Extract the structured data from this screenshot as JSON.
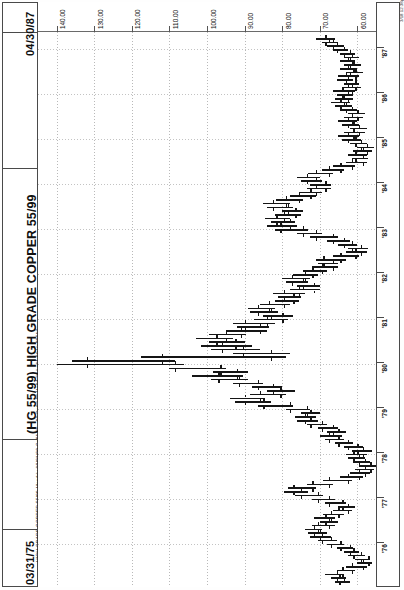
{
  "header": {
    "date_end": "04/30/87",
    "date_start": "03/31/75",
    "title": "(HG 55/99) HIGH GRADE COPPER 55/99",
    "stats_line": "HIGH GRADE COPPER 55/99-Monthly  03/31/99  C=61.75  -.60  O=62.55  H=64.75  L=61.60  V=89517",
    "copyright": "3/18 12:38pm Printed using TradeStation © Omega Research, Inc. 1997"
  },
  "chart_data": {
    "type": "bar",
    "subtype": "ohlc-bar-chart-rotated-90ccw",
    "title": "(HG 55/99) HIGH GRADE COPPER 55/99",
    "xlabel": "Date (monthly)",
    "ylabel": "Price (cents per pound)",
    "xlim": [
      "1975-03-31",
      "1987-04-30"
    ],
    "ylim": [
      55.0,
      145.0
    ],
    "grid": true,
    "legend": false,
    "price_ticks": [
      "140.00",
      "130.00",
      "120.00",
      "110.00",
      "100.00",
      "90.00",
      "80.00",
      "70.00",
      "60.00"
    ],
    "price_tick_values": [
      140,
      130,
      120,
      110,
      100,
      90,
      80,
      70,
      60
    ],
    "year_ticks": [
      "'76",
      "'77",
      "'78",
      "'79",
      "'80",
      "'81",
      "'82",
      "'83",
      "'84",
      "'85",
      "'86",
      "'87"
    ],
    "year_tick_values": [
      1976,
      1977,
      1978,
      1979,
      1980,
      1981,
      1982,
      1983,
      1984,
      1985,
      1986,
      1987
    ],
    "quote": {
      "symbol": "HG 55/99",
      "name": "HIGH GRADE COPPER 55/99",
      "interval": "Monthly",
      "date": "03/31/99",
      "close": 61.75,
      "change": -0.6,
      "open": 62.55,
      "high": 64.75,
      "low": 61.6,
      "volume": 89517
    },
    "bars": [
      {
        "t": "1975-03",
        "o": 63.5,
        "h": 66.0,
        "l": 62.0,
        "c": 64.8
      },
      {
        "t": "1975-04",
        "o": 64.8,
        "h": 67.0,
        "l": 63.0,
        "c": 65.5
      },
      {
        "t": "1975-05",
        "o": 65.5,
        "h": 68.5,
        "l": 63.5,
        "c": 64.0
      },
      {
        "t": "1975-06",
        "o": 64.0,
        "h": 65.5,
        "l": 60.5,
        "c": 61.5
      },
      {
        "t": "1975-07",
        "o": 61.5,
        "h": 63.0,
        "l": 57.5,
        "c": 58.5
      },
      {
        "t": "1975-08",
        "o": 58.5,
        "h": 60.0,
        "l": 56.0,
        "c": 57.0
      },
      {
        "t": "1975-09",
        "o": 57.0,
        "h": 60.5,
        "l": 56.5,
        "c": 59.0
      },
      {
        "t": "1975-10",
        "o": 59.0,
        "h": 62.5,
        "l": 58.0,
        "c": 61.0
      },
      {
        "t": "1975-11",
        "o": 61.0,
        "h": 63.5,
        "l": 59.5,
        "c": 62.0
      },
      {
        "t": "1975-12",
        "o": 62.0,
        "h": 65.5,
        "l": 61.0,
        "c": 64.5
      },
      {
        "t": "1976-01",
        "o": 64.5,
        "h": 68.0,
        "l": 63.5,
        "c": 67.0
      },
      {
        "t": "1976-02",
        "o": 67.0,
        "h": 70.5,
        "l": 65.5,
        "c": 69.5
      },
      {
        "t": "1976-03",
        "o": 69.5,
        "h": 72.5,
        "l": 67.0,
        "c": 70.0
      },
      {
        "t": "1976-04",
        "o": 70.0,
        "h": 73.0,
        "l": 68.0,
        "c": 71.5
      },
      {
        "t": "1976-05",
        "o": 71.5,
        "h": 74.0,
        "l": 69.5,
        "c": 70.5
      },
      {
        "t": "1976-06",
        "o": 70.5,
        "h": 72.0,
        "l": 66.0,
        "c": 67.5
      },
      {
        "t": "1976-07",
        "o": 67.5,
        "h": 70.0,
        "l": 65.0,
        "c": 68.5
      },
      {
        "t": "1976-08",
        "o": 68.5,
        "h": 71.5,
        "l": 66.0,
        "c": 67.0
      },
      {
        "t": "1976-09",
        "o": 67.0,
        "h": 69.0,
        "l": 63.5,
        "c": 65.0
      },
      {
        "t": "1976-10",
        "o": 65.0,
        "h": 66.5,
        "l": 61.5,
        "c": 62.5
      },
      {
        "t": "1976-11",
        "o": 62.5,
        "h": 65.0,
        "l": 60.5,
        "c": 64.0
      },
      {
        "t": "1976-12",
        "o": 64.0,
        "h": 68.5,
        "l": 63.0,
        "c": 67.5
      },
      {
        "t": "1977-01",
        "o": 67.5,
        "h": 72.0,
        "l": 66.0,
        "c": 70.5
      },
      {
        "t": "1977-02",
        "o": 70.5,
        "h": 76.5,
        "l": 69.0,
        "c": 75.0
      },
      {
        "t": "1977-03",
        "o": 75.0,
        "h": 79.5,
        "l": 73.0,
        "c": 77.0
      },
      {
        "t": "1977-04",
        "o": 77.0,
        "h": 78.5,
        "l": 71.0,
        "c": 72.0
      },
      {
        "t": "1977-05",
        "o": 72.0,
        "h": 73.5,
        "l": 66.5,
        "c": 67.5
      },
      {
        "t": "1977-06",
        "o": 67.5,
        "h": 69.0,
        "l": 61.5,
        "c": 62.5
      },
      {
        "t": "1977-07",
        "o": 62.5,
        "h": 64.5,
        "l": 58.5,
        "c": 59.5
      },
      {
        "t": "1977-08",
        "o": 59.5,
        "h": 62.0,
        "l": 56.5,
        "c": 58.0
      },
      {
        "t": "1977-09",
        "o": 58.0,
        "h": 60.5,
        "l": 55.5,
        "c": 56.5
      },
      {
        "t": "1977-10",
        "o": 56.5,
        "h": 59.5,
        "l": 55.0,
        "c": 58.0
      },
      {
        "t": "1977-11",
        "o": 58.0,
        "h": 61.0,
        "l": 56.5,
        "c": 59.5
      },
      {
        "t": "1977-12",
        "o": 59.5,
        "h": 62.5,
        "l": 58.0,
        "c": 61.0
      },
      {
        "t": "1978-01",
        "o": 61.0,
        "h": 63.0,
        "l": 57.5,
        "c": 58.5
      },
      {
        "t": "1978-02",
        "o": 58.5,
        "h": 61.5,
        "l": 56.0,
        "c": 60.0
      },
      {
        "t": "1978-03",
        "o": 60.0,
        "h": 63.5,
        "l": 58.5,
        "c": 62.5
      },
      {
        "t": "1978-04",
        "o": 62.5,
        "h": 66.0,
        "l": 61.0,
        "c": 65.0
      },
      {
        "t": "1978-05",
        "o": 65.0,
        "h": 68.5,
        "l": 63.5,
        "c": 67.5
      },
      {
        "t": "1978-06",
        "o": 67.5,
        "h": 70.0,
        "l": 64.0,
        "c": 65.0
      },
      {
        "t": "1978-07",
        "o": 65.0,
        "h": 68.0,
        "l": 63.0,
        "c": 66.5
      },
      {
        "t": "1978-08",
        "o": 66.5,
        "h": 70.5,
        "l": 65.0,
        "c": 69.5
      },
      {
        "t": "1978-09",
        "o": 69.5,
        "h": 73.5,
        "l": 68.0,
        "c": 72.5
      },
      {
        "t": "1978-10",
        "o": 72.5,
        "h": 76.0,
        "l": 70.5,
        "c": 74.0
      },
      {
        "t": "1978-11",
        "o": 74.0,
        "h": 76.5,
        "l": 71.0,
        "c": 72.5
      },
      {
        "t": "1978-12",
        "o": 72.5,
        "h": 75.0,
        "l": 70.0,
        "c": 73.5
      },
      {
        "t": "1979-01",
        "o": 73.5,
        "h": 79.0,
        "l": 72.5,
        "c": 78.0
      },
      {
        "t": "1979-02",
        "o": 78.0,
        "h": 86.5,
        "l": 77.0,
        "c": 85.0
      },
      {
        "t": "1979-03",
        "o": 85.0,
        "h": 92.5,
        "l": 83.0,
        "c": 90.0
      },
      {
        "t": "1979-04",
        "o": 90.0,
        "h": 94.0,
        "l": 84.5,
        "c": 86.0
      },
      {
        "t": "1979-05",
        "o": 86.0,
        "h": 88.5,
        "l": 79.0,
        "c": 80.5
      },
      {
        "t": "1979-06",
        "o": 80.5,
        "h": 84.0,
        "l": 76.5,
        "c": 82.5
      },
      {
        "t": "1979-07",
        "o": 82.5,
        "h": 88.0,
        "l": 80.0,
        "c": 86.5
      },
      {
        "t": "1979-08",
        "o": 86.5,
        "h": 93.0,
        "l": 85.0,
        "c": 91.5
      },
      {
        "t": "1979-09",
        "o": 91.5,
        "h": 99.0,
        "l": 89.0,
        "c": 97.0
      },
      {
        "t": "1979-10",
        "o": 97.0,
        "h": 104.0,
        "l": 90.5,
        "c": 92.0
      },
      {
        "t": "1979-11",
        "o": 92.0,
        "h": 98.5,
        "l": 89.0,
        "c": 96.5
      },
      {
        "t": "1979-12",
        "o": 96.5,
        "h": 110.0,
        "l": 95.0,
        "c": 108.5
      },
      {
        "t": "1980-01",
        "o": 108.5,
        "h": 140.0,
        "l": 106.0,
        "c": 132.0
      },
      {
        "t": "1980-02",
        "o": 132.0,
        "h": 136.0,
        "l": 108.5,
        "c": 112.0
      },
      {
        "t": "1980-03",
        "o": 112.0,
        "h": 117.5,
        "l": 79.0,
        "c": 83.0
      },
      {
        "t": "1980-04",
        "o": 83.0,
        "h": 93.0,
        "l": 78.0,
        "c": 90.5
      },
      {
        "t": "1980-05",
        "o": 90.5,
        "h": 99.0,
        "l": 86.0,
        "c": 96.0
      },
      {
        "t": "1980-06",
        "o": 96.0,
        "h": 101.5,
        "l": 88.0,
        "c": 92.5
      },
      {
        "t": "1980-07",
        "o": 92.5,
        "h": 99.5,
        "l": 90.0,
        "c": 97.5
      },
      {
        "t": "1980-08",
        "o": 97.5,
        "h": 103.0,
        "l": 93.0,
        "c": 95.0
      },
      {
        "t": "1980-09",
        "o": 95.0,
        "h": 99.5,
        "l": 89.5,
        "c": 91.0
      },
      {
        "t": "1980-10",
        "o": 91.0,
        "h": 95.0,
        "l": 84.0,
        "c": 86.0
      },
      {
        "t": "1980-11",
        "o": 86.0,
        "h": 92.0,
        "l": 83.5,
        "c": 90.0
      },
      {
        "t": "1980-12",
        "o": 90.0,
        "h": 93.0,
        "l": 82.0,
        "c": 84.0
      },
      {
        "t": "1981-01",
        "o": 84.0,
        "h": 87.5,
        "l": 78.5,
        "c": 80.0
      },
      {
        "t": "1981-02",
        "o": 80.0,
        "h": 85.0,
        "l": 77.0,
        "c": 83.0
      },
      {
        "t": "1981-03",
        "o": 83.0,
        "h": 88.5,
        "l": 81.0,
        "c": 86.5
      },
      {
        "t": "1981-04",
        "o": 86.5,
        "h": 89.0,
        "l": 82.0,
        "c": 83.5
      },
      {
        "t": "1981-05",
        "o": 83.5,
        "h": 86.0,
        "l": 78.0,
        "c": 79.5
      },
      {
        "t": "1981-06",
        "o": 79.5,
        "h": 82.0,
        "l": 75.5,
        "c": 77.0
      },
      {
        "t": "1981-07",
        "o": 77.0,
        "h": 81.0,
        "l": 75.0,
        "c": 79.5
      },
      {
        "t": "1981-08",
        "o": 79.5,
        "h": 82.5,
        "l": 74.0,
        "c": 75.5
      },
      {
        "t": "1981-09",
        "o": 75.5,
        "h": 78.0,
        "l": 70.0,
        "c": 71.5
      },
      {
        "t": "1981-10",
        "o": 71.5,
        "h": 76.0,
        "l": 70.0,
        "c": 74.5
      },
      {
        "t": "1981-11",
        "o": 74.5,
        "h": 79.0,
        "l": 73.0,
        "c": 77.5
      },
      {
        "t": "1981-12",
        "o": 77.5,
        "h": 80.0,
        "l": 72.5,
        "c": 74.0
      },
      {
        "t": "1982-01",
        "o": 74.0,
        "h": 77.0,
        "l": 70.5,
        "c": 72.0
      },
      {
        "t": "1982-02",
        "o": 72.0,
        "h": 74.5,
        "l": 68.0,
        "c": 69.5
      },
      {
        "t": "1982-03",
        "o": 69.5,
        "h": 72.0,
        "l": 65.0,
        "c": 66.5
      },
      {
        "t": "1982-04",
        "o": 66.5,
        "h": 70.5,
        "l": 65.0,
        "c": 69.0
      },
      {
        "t": "1982-05",
        "o": 69.0,
        "h": 71.0,
        "l": 63.0,
        "c": 64.5
      },
      {
        "t": "1982-06",
        "o": 64.5,
        "h": 66.5,
        "l": 59.5,
        "c": 60.5
      },
      {
        "t": "1982-07",
        "o": 60.5,
        "h": 63.0,
        "l": 57.5,
        "c": 59.0
      },
      {
        "t": "1982-08",
        "o": 59.0,
        "h": 62.5,
        "l": 57.0,
        "c": 61.5
      },
      {
        "t": "1982-09",
        "o": 61.5,
        "h": 65.0,
        "l": 60.0,
        "c": 63.5
      },
      {
        "t": "1982-10",
        "o": 63.5,
        "h": 68.0,
        "l": 62.0,
        "c": 66.5
      },
      {
        "t": "1982-11",
        "o": 66.5,
        "h": 72.5,
        "l": 65.0,
        "c": 71.0
      },
      {
        "t": "1982-12",
        "o": 71.0,
        "h": 76.0,
        "l": 69.5,
        "c": 74.5
      },
      {
        "t": "1983-01",
        "o": 74.5,
        "h": 82.0,
        "l": 73.0,
        "c": 80.5
      },
      {
        "t": "1983-02",
        "o": 80.5,
        "h": 84.0,
        "l": 76.0,
        "c": 78.0
      },
      {
        "t": "1983-03",
        "o": 78.0,
        "h": 83.0,
        "l": 76.5,
        "c": 81.5
      },
      {
        "t": "1983-04",
        "o": 81.5,
        "h": 84.5,
        "l": 78.0,
        "c": 79.5
      },
      {
        "t": "1983-05",
        "o": 79.5,
        "h": 82.0,
        "l": 75.0,
        "c": 76.5
      },
      {
        "t": "1983-06",
        "o": 76.5,
        "h": 80.0,
        "l": 74.5,
        "c": 78.5
      },
      {
        "t": "1983-07",
        "o": 78.5,
        "h": 84.0,
        "l": 77.0,
        "c": 82.5
      },
      {
        "t": "1983-08",
        "o": 82.5,
        "h": 85.0,
        "l": 78.0,
        "c": 79.0
      },
      {
        "t": "1983-09",
        "o": 79.0,
        "h": 81.5,
        "l": 74.5,
        "c": 75.5
      },
      {
        "t": "1983-10",
        "o": 75.5,
        "h": 78.0,
        "l": 71.0,
        "c": 72.5
      },
      {
        "t": "1983-11",
        "o": 72.5,
        "h": 75.5,
        "l": 69.5,
        "c": 71.0
      },
      {
        "t": "1983-12",
        "o": 71.0,
        "h": 73.5,
        "l": 67.0,
        "c": 68.5
      },
      {
        "t": "1984-01",
        "o": 68.5,
        "h": 72.5,
        "l": 67.0,
        "c": 71.0
      },
      {
        "t": "1984-02",
        "o": 71.0,
        "h": 75.0,
        "l": 69.5,
        "c": 73.5
      },
      {
        "t": "1984-03",
        "o": 73.5,
        "h": 76.0,
        "l": 70.0,
        "c": 71.0
      },
      {
        "t": "1984-04",
        "o": 71.0,
        "h": 73.0,
        "l": 66.5,
        "c": 67.5
      },
      {
        "t": "1984-05",
        "o": 67.5,
        "h": 69.5,
        "l": 63.5,
        "c": 64.5
      },
      {
        "t": "1984-06",
        "o": 64.5,
        "h": 66.5,
        "l": 60.5,
        "c": 61.5
      },
      {
        "t": "1984-07",
        "o": 61.5,
        "h": 63.0,
        "l": 57.5,
        "c": 58.5
      },
      {
        "t": "1984-08",
        "o": 58.5,
        "h": 61.5,
        "l": 57.0,
        "c": 60.5
      },
      {
        "t": "1984-09",
        "o": 60.5,
        "h": 62.5,
        "l": 57.5,
        "c": 58.5
      },
      {
        "t": "1984-10",
        "o": 58.5,
        "h": 61.0,
        "l": 56.0,
        "c": 57.5
      },
      {
        "t": "1984-11",
        "o": 57.5,
        "h": 60.0,
        "l": 55.5,
        "c": 59.0
      },
      {
        "t": "1984-12",
        "o": 59.0,
        "h": 62.0,
        "l": 57.5,
        "c": 60.5
      },
      {
        "t": "1985-01",
        "o": 60.5,
        "h": 64.0,
        "l": 59.0,
        "c": 62.5
      },
      {
        "t": "1985-02",
        "o": 62.5,
        "h": 65.0,
        "l": 59.5,
        "c": 61.0
      },
      {
        "t": "1985-03",
        "o": 61.0,
        "h": 63.5,
        "l": 58.0,
        "c": 59.5
      },
      {
        "t": "1985-04",
        "o": 59.5,
        "h": 62.0,
        "l": 57.5,
        "c": 61.0
      },
      {
        "t": "1985-05",
        "o": 61.0,
        "h": 64.0,
        "l": 59.5,
        "c": 62.5
      },
      {
        "t": "1985-06",
        "o": 62.5,
        "h": 65.0,
        "l": 60.0,
        "c": 61.5
      },
      {
        "t": "1985-07",
        "o": 61.5,
        "h": 63.5,
        "l": 58.5,
        "c": 60.0
      },
      {
        "t": "1985-08",
        "o": 60.0,
        "h": 62.5,
        "l": 58.0,
        "c": 61.5
      },
      {
        "t": "1985-09",
        "o": 61.5,
        "h": 64.5,
        "l": 60.0,
        "c": 63.0
      },
      {
        "t": "1985-10",
        "o": 63.0,
        "h": 66.0,
        "l": 61.5,
        "c": 64.5
      },
      {
        "t": "1985-11",
        "o": 64.5,
        "h": 67.0,
        "l": 62.0,
        "c": 63.5
      },
      {
        "t": "1985-12",
        "o": 63.5,
        "h": 66.0,
        "l": 61.0,
        "c": 62.5
      },
      {
        "t": "1986-01",
        "o": 62.5,
        "h": 65.5,
        "l": 61.0,
        "c": 64.0
      },
      {
        "t": "1986-02",
        "o": 64.0,
        "h": 66.5,
        "l": 60.5,
        "c": 61.5
      },
      {
        "t": "1986-03",
        "o": 61.5,
        "h": 64.0,
        "l": 59.0,
        "c": 60.5
      },
      {
        "t": "1986-04",
        "o": 60.5,
        "h": 63.5,
        "l": 59.5,
        "c": 62.5
      },
      {
        "t": "1986-05",
        "o": 62.5,
        "h": 65.5,
        "l": 61.0,
        "c": 63.0
      },
      {
        "t": "1986-06",
        "o": 63.0,
        "h": 65.0,
        "l": 59.5,
        "c": 60.5
      },
      {
        "t": "1986-07",
        "o": 60.5,
        "h": 63.0,
        "l": 58.5,
        "c": 62.0
      },
      {
        "t": "1986-08",
        "o": 62.0,
        "h": 64.5,
        "l": 60.0,
        "c": 61.0
      },
      {
        "t": "1986-09",
        "o": 61.0,
        "h": 63.5,
        "l": 59.0,
        "c": 62.5
      },
      {
        "t": "1986-10",
        "o": 62.5,
        "h": 64.5,
        "l": 60.5,
        "c": 61.5
      },
      {
        "t": "1986-11",
        "o": 61.5,
        "h": 63.5,
        "l": 59.5,
        "c": 62.0
      },
      {
        "t": "1986-12",
        "o": 62.0,
        "h": 64.5,
        "l": 60.5,
        "c": 63.5
      },
      {
        "t": "1987-01",
        "o": 63.5,
        "h": 66.5,
        "l": 62.5,
        "c": 65.5
      },
      {
        "t": "1987-02",
        "o": 65.5,
        "h": 68.0,
        "l": 63.5,
        "c": 66.5
      },
      {
        "t": "1987-03",
        "o": 66.5,
        "h": 69.5,
        "l": 65.0,
        "c": 68.5
      },
      {
        "t": "1987-04",
        "o": 68.5,
        "h": 71.0,
        "l": 66.0,
        "c": 67.5
      }
    ]
  }
}
